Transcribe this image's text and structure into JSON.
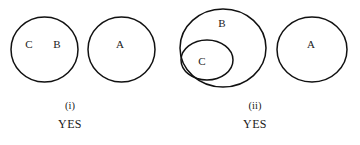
{
  "page": {
    "background_color": "#ffffff",
    "ink_color": "#111111",
    "width": 360,
    "height": 145
  },
  "diagrams": [
    {
      "id": "diagram-i",
      "caption_index": "(i)",
      "caption_answer": "YES",
      "caption_center_x": 70,
      "circles": [
        {
          "name": "circle-cb",
          "cx": 44.5,
          "cy": 49.5,
          "rx": 33.5,
          "ry": 32.5,
          "labels": [
            {
              "name": "set-label-c",
              "text": "C",
              "x": 29,
              "y": 45
            },
            {
              "name": "set-label-b",
              "text": "B",
              "x": 57,
              "y": 45
            }
          ]
        },
        {
          "name": "circle-a",
          "cx": 121.5,
          "cy": 49.5,
          "rx": 33.5,
          "ry": 32.5,
          "labels": [
            {
              "name": "set-label-a",
              "text": "A",
              "x": 120,
              "y": 45
            }
          ]
        }
      ]
    },
    {
      "id": "diagram-ii",
      "caption_index": "(ii)",
      "caption_answer": "YES",
      "caption_center_x": 255,
      "circles": [
        {
          "name": "circle-b-outer",
          "cx": 223,
          "cy": 48,
          "rx": 43,
          "ry": 39,
          "labels": [
            {
              "name": "set-label-b",
              "text": "B",
              "x": 222,
              "y": 24
            }
          ]
        },
        {
          "name": "circle-c-inner",
          "cx": 207,
          "cy": 60,
          "rx": 26,
          "ry": 20,
          "labels": [
            {
              "name": "set-label-c",
              "text": "C",
              "x": 202,
              "y": 62
            }
          ]
        },
        {
          "name": "circle-a",
          "cx": 312,
          "cy": 49.5,
          "rx": 35,
          "ry": 32.5,
          "labels": [
            {
              "name": "set-label-a",
              "text": "A",
              "x": 311,
              "y": 45
            }
          ]
        }
      ]
    }
  ],
  "captions": {
    "diagram_i_index": "(i)",
    "diagram_i_answer": "YES",
    "diagram_ii_index": "(ii)",
    "diagram_ii_answer": "YES"
  }
}
